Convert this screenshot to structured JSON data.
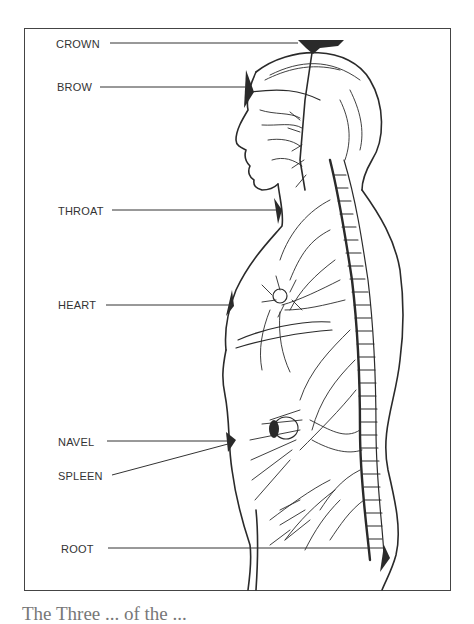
{
  "figure": {
    "type": "anatomical-diagram",
    "labels": [
      {
        "id": "crown",
        "text": "CROWN"
      },
      {
        "id": "brow",
        "text": "BROW"
      },
      {
        "id": "throat",
        "text": "THROAT"
      },
      {
        "id": "heart",
        "text": "HEART"
      },
      {
        "id": "navel",
        "text": "NAVEL"
      },
      {
        "id": "spleen",
        "text": "SPLEEN"
      },
      {
        "id": "root",
        "text": "ROOT"
      }
    ],
    "caption": "The Three ... of the ..."
  },
  "colors": {
    "line": "#2a2a2a",
    "label": "#333333",
    "frame": "#444444",
    "background": "#ffffff"
  }
}
